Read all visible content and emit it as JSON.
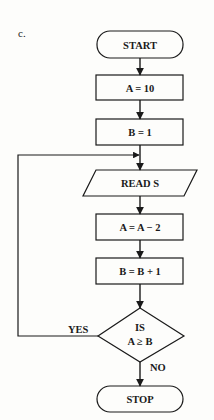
{
  "figure_label": "c.",
  "flowchart": {
    "start": "START",
    "step1": "A = 10",
    "step2": "B = 1",
    "input": "READ S",
    "step3": "A = A − 2",
    "step4": "B = B + 1",
    "decision_line1": "IS",
    "decision_line2": "A ≥ B",
    "yes_label": "YES",
    "no_label": "NO",
    "stop": "STOP"
  },
  "colors": {
    "ink": "#1a1a1a",
    "paper": "#fdfdfb"
  }
}
